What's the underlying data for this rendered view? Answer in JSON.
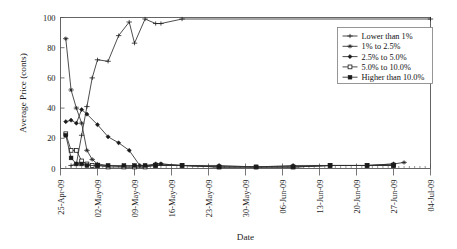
{
  "chart_data": {
    "type": "line",
    "title": "",
    "xlabel": "Date",
    "ylabel": "Average Price (conts)",
    "ylim": [
      0,
      100
    ],
    "yticks": [
      0,
      20,
      40,
      60,
      80,
      100
    ],
    "ytick_labels": [
      "0",
      "20",
      "40",
      "60",
      "80",
      "100"
    ],
    "xlim": [
      "25-Apr-09",
      "04-Jul-09"
    ],
    "xticks": [
      0,
      7,
      14,
      21,
      28,
      35,
      42,
      49,
      56,
      63,
      70
    ],
    "xtick_labels": [
      "25-Apr-09",
      "02-May-09",
      "09-May-09",
      "16-May-09",
      "23-May-09",
      "30-May-09",
      "06-Jun-09",
      "13-Jun-09",
      "20-Jun-09",
      "27-Jun-09",
      "04-Jul-09"
    ],
    "minor_tick_interval_days": 1,
    "grid": false,
    "legend_position": "top-right",
    "series": [
      {
        "name": "Lower than 1%",
        "marker": "plus",
        "points": [
          {
            "x": 2,
            "y": 2
          },
          {
            "x": 3,
            "y": 3
          },
          {
            "x": 4,
            "y": 22
          },
          {
            "x": 5,
            "y": 41
          },
          {
            "x": 6,
            "y": 60
          },
          {
            "x": 7,
            "y": 72
          },
          {
            "x": 9,
            "y": 71
          },
          {
            "x": 11,
            "y": 88
          },
          {
            "x": 13,
            "y": 97
          },
          {
            "x": 14,
            "y": 83
          },
          {
            "x": 16,
            "y": 99
          },
          {
            "x": 18,
            "y": 96
          },
          {
            "x": 19,
            "y": 96
          },
          {
            "x": 23,
            "y": 99
          },
          {
            "x": 70,
            "y": 99
          }
        ]
      },
      {
        "name": "1% to 2.5%",
        "marker": "asterisk",
        "points": [
          {
            "x": 1,
            "y": 86
          },
          {
            "x": 2,
            "y": 52
          },
          {
            "x": 3,
            "y": 40
          },
          {
            "x": 4,
            "y": 30
          },
          {
            "x": 5,
            "y": 12
          },
          {
            "x": 6,
            "y": 6
          },
          {
            "x": 7,
            "y": 3
          },
          {
            "x": 9,
            "y": 2
          },
          {
            "x": 12,
            "y": 1
          },
          {
            "x": 14,
            "y": 1
          },
          {
            "x": 16,
            "y": 1
          },
          {
            "x": 18,
            "y": 3
          },
          {
            "x": 19,
            "y": 3
          },
          {
            "x": 23,
            "y": 2
          },
          {
            "x": 30,
            "y": 1
          },
          {
            "x": 37,
            "y": 1
          },
          {
            "x": 44,
            "y": 1
          },
          {
            "x": 51,
            "y": 2
          },
          {
            "x": 58,
            "y": 2
          },
          {
            "x": 63,
            "y": 3
          },
          {
            "x": 65,
            "y": 4
          }
        ]
      },
      {
        "name": "2.5% to 5.0%",
        "marker": "diamond",
        "points": [
          {
            "x": 1,
            "y": 31
          },
          {
            "x": 2,
            "y": 32
          },
          {
            "x": 3,
            "y": 30
          },
          {
            "x": 4,
            "y": 39
          },
          {
            "x": 5,
            "y": 36
          },
          {
            "x": 7,
            "y": 29
          },
          {
            "x": 9,
            "y": 21
          },
          {
            "x": 11,
            "y": 17
          },
          {
            "x": 13,
            "y": 12
          },
          {
            "x": 15,
            "y": 2
          },
          {
            "x": 16,
            "y": 2
          },
          {
            "x": 18,
            "y": 3
          },
          {
            "x": 19,
            "y": 3
          },
          {
            "x": 23,
            "y": 2
          },
          {
            "x": 30,
            "y": 2
          },
          {
            "x": 37,
            "y": 1
          },
          {
            "x": 44,
            "y": 2
          },
          {
            "x": 51,
            "y": 2
          },
          {
            "x": 58,
            "y": 2
          },
          {
            "x": 63,
            "y": 3
          }
        ]
      },
      {
        "name": "5.0% to 10.0%",
        "marker": "square-open",
        "points": [
          {
            "x": 1,
            "y": 23
          },
          {
            "x": 2,
            "y": 12
          },
          {
            "x": 3,
            "y": 12
          },
          {
            "x": 4,
            "y": 5
          },
          {
            "x": 5,
            "y": 3
          },
          {
            "x": 6,
            "y": 2
          },
          {
            "x": 7,
            "y": 2
          },
          {
            "x": 9,
            "y": 1
          },
          {
            "x": 12,
            "y": 1
          },
          {
            "x": 14,
            "y": 1
          },
          {
            "x": 16,
            "y": 1
          },
          {
            "x": 18,
            "y": 2
          },
          {
            "x": 23,
            "y": 2
          },
          {
            "x": 30,
            "y": 1
          },
          {
            "x": 37,
            "y": 1
          },
          {
            "x": 44,
            "y": 1
          },
          {
            "x": 51,
            "y": 2
          },
          {
            "x": 58,
            "y": 2
          },
          {
            "x": 63,
            "y": 2
          }
        ]
      },
      {
        "name": "Higher than 10.0%",
        "marker": "square-filled",
        "points": [
          {
            "x": 1,
            "y": 22
          },
          {
            "x": 2,
            "y": 7
          },
          {
            "x": 3,
            "y": 3
          },
          {
            "x": 4,
            "y": 3
          },
          {
            "x": 5,
            "y": 2
          },
          {
            "x": 7,
            "y": 2
          },
          {
            "x": 9,
            "y": 2
          },
          {
            "x": 12,
            "y": 2
          },
          {
            "x": 14,
            "y": 2
          },
          {
            "x": 16,
            "y": 2
          },
          {
            "x": 18,
            "y": 2
          },
          {
            "x": 23,
            "y": 2
          },
          {
            "x": 30,
            "y": 1
          },
          {
            "x": 37,
            "y": 1
          },
          {
            "x": 44,
            "y": 1
          },
          {
            "x": 51,
            "y": 2
          },
          {
            "x": 58,
            "y": 2
          },
          {
            "x": 63,
            "y": 2
          }
        ]
      }
    ]
  },
  "legend": {
    "items": [
      {
        "label": "Lower than 1%",
        "marker": "plus"
      },
      {
        "label": "1% to 2.5%",
        "marker": "asterisk"
      },
      {
        "label": "2.5% to 5.0%",
        "marker": "diamond"
      },
      {
        "label": "5.0% to 10.0%",
        "marker": "square-open"
      },
      {
        "label": "Higher than 10.0%",
        "marker": "square-filled"
      }
    ]
  },
  "colors": {
    "line": "#2e2e2e",
    "axis": "#555555",
    "text": "#1a1a1a",
    "background": "#ffffff"
  }
}
